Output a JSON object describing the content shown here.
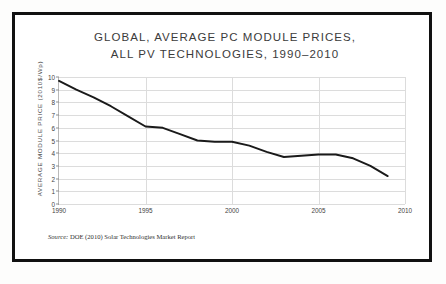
{
  "figure": {
    "title_lines": [
      "GLOBAL, AVERAGE PC MODULE PRICES,",
      "ALL PV TECHNOLOGIES, 1990–2010"
    ],
    "source_prefix": "Source:",
    "source_text": "DOE (2010) Solar Technologies Market Report",
    "frame_color": "#111111",
    "line_color": "#1a1a1a",
    "grid_color": "#dcdcdc",
    "text_color": "#3b3b3b"
  },
  "chart_data": {
    "type": "line",
    "title": "GLOBAL, AVERAGE PC MODULE PRICES, ALL PV TECHNOLOGIES, 1990–2010",
    "xlabel": "",
    "ylabel": "AVERAGE MODULE PRICE (2010$/Wp)",
    "xlim": [
      1990,
      2010
    ],
    "ylim": [
      0,
      10
    ],
    "grid": true,
    "legend": "none",
    "xticks": [
      1990,
      1995,
      2000,
      2005,
      2010
    ],
    "yticks": [
      0,
      1,
      2,
      3,
      4,
      5,
      6,
      7,
      8,
      9,
      10
    ],
    "x": [
      1990,
      1991,
      1992,
      1993,
      1994,
      1995,
      1996,
      1997,
      1998,
      1999,
      2000,
      2001,
      2002,
      2003,
      2004,
      2005,
      2006,
      2007,
      2008,
      2009
    ],
    "values": [
      9.7,
      9.0,
      8.4,
      7.7,
      6.9,
      6.1,
      6.0,
      5.5,
      5.0,
      4.9,
      4.9,
      4.6,
      4.1,
      3.7,
      3.8,
      3.9,
      3.9,
      3.6,
      3.0,
      2.2
    ],
    "series": [
      {
        "name": "Average module price",
        "values": [
          9.7,
          9.0,
          8.4,
          7.7,
          6.9,
          6.1,
          6.0,
          5.5,
          5.0,
          4.9,
          4.9,
          4.6,
          4.1,
          3.7,
          3.8,
          3.9,
          3.9,
          3.6,
          3.0,
          2.2
        ]
      }
    ]
  }
}
